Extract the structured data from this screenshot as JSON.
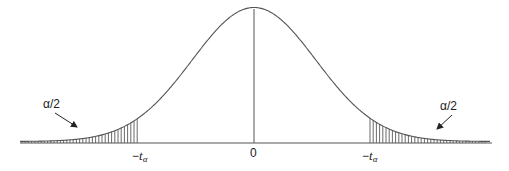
{
  "diagram": {
    "type": "normal-distribution-two-tailed",
    "center_label": "0",
    "left_cutoff": {
      "prefix": "−",
      "var": "t",
      "sub": "α"
    },
    "right_cutoff": {
      "prefix": "−",
      "var": "t",
      "sub": "α"
    },
    "left_tail_label": "α/2",
    "right_tail_label": "α/2",
    "colors": {
      "line": "#555555",
      "hatch": "#444444",
      "text": "#222222",
      "background": "#ffffff"
    }
  }
}
